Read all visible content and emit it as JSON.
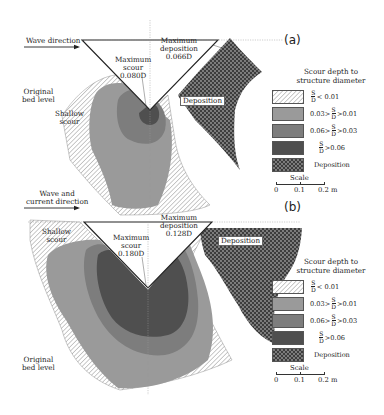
{
  "figure": {
    "colors": {
      "hatch_light": "#ffffff",
      "hatch_line": "#8a8a8a",
      "level1": "#9a9a9a",
      "level2": "#7d7d7d",
      "level3": "#4f4f4f",
      "deposition": "#3d3d3d",
      "deposition_dot": "#9a9a9a"
    }
  },
  "panel_a": {
    "tag": "(a)",
    "flow_label": "Wave direction",
    "max_scour_label": [
      "Maximum",
      "scour",
      "0.080D"
    ],
    "max_deposition_label": [
      "Maximum",
      "deposition",
      "0.066D"
    ],
    "original_bed_label": [
      "Original",
      "bed level"
    ],
    "shallow_scour_label": [
      "Shallow",
      "scour"
    ],
    "deposition_label": "Deposition"
  },
  "panel_b": {
    "tag": "(b)",
    "flow_label": [
      "Wave and",
      "current direction"
    ],
    "max_scour_label": [
      "Maximum",
      "scour",
      "0.180D"
    ],
    "max_deposition_label": [
      "Maximum",
      "deposition",
      "0.128D"
    ],
    "original_bed_label": [
      "Original",
      "bed level"
    ],
    "shallow_scour_label": [
      "Shallow",
      "scour"
    ],
    "deposition_label": "Deposition"
  },
  "legend": {
    "title": [
      "Scour depth to",
      "structure diameter"
    ],
    "items": [
      {
        "swatch": "hatch",
        "prefix": "",
        "num": "S",
        "den": "D",
        "suffix": "< 0.01"
      },
      {
        "swatch": "level1",
        "prefix": "0.03>",
        "num": "S",
        "den": "D",
        "suffix": ">0.01"
      },
      {
        "swatch": "level2",
        "prefix": "0.06>",
        "num": "S",
        "den": "D",
        "suffix": ">0.03"
      },
      {
        "swatch": "level3",
        "prefix": "",
        "num": "S",
        "den": "D",
        "suffix": ">0.06"
      },
      {
        "swatch": "deposition",
        "prefix": "",
        "num": "",
        "den": "",
        "suffix": "Deposition"
      }
    ],
    "scale": {
      "title": "Scale",
      "ticks": [
        "0",
        "0.1",
        "0.2 m"
      ]
    }
  }
}
